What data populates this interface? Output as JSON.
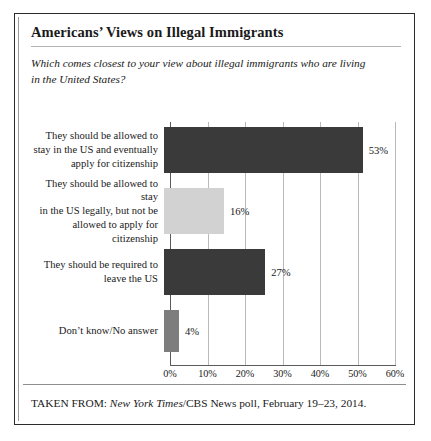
{
  "figure": {
    "title": "Americans’ Views on Illegal Immigrants",
    "subtitle": "Which comes closest to your view about illegal immigrants who are living in the United States?",
    "source_prefix": "TAKEN FROM: ",
    "source_italic": "New York Times",
    "source_rest": "/CBS News poll, February 19–23, 2014."
  },
  "chart_data": {
    "type": "bar",
    "orientation": "horizontal",
    "title": "Americans’ Views on Illegal Immigrants",
    "subtitle": "Which comes closest to your view about illegal immigrants who are living in the United States?",
    "xlabel": "",
    "ylabel": "",
    "xlim": [
      0,
      60
    ],
    "xticks": [
      0,
      10,
      20,
      30,
      40,
      50,
      60
    ],
    "xtick_labels": [
      "0%",
      "10%",
      "20%",
      "30%",
      "40%",
      "50%",
      "60%"
    ],
    "grid": true,
    "legend": "none",
    "categories": [
      "They should be allowed to stay in the US and eventually apply for citizenship",
      "They should be allowed to stay in the US legally, but not be allowed to apply for citizenship",
      "They should be required to leave the US",
      "Don’t know/No answer"
    ],
    "values": [
      53,
      16,
      27,
      4
    ],
    "value_labels": [
      "53%",
      "16%",
      "27%",
      "4%"
    ],
    "bar_colors": [
      "#3a3a3a",
      "#d2d2d2",
      "#3a3a3a",
      "#7d7d7d"
    ]
  },
  "bars": [
    {
      "label_lines": [
        "They should be allowed to",
        "stay in the US and eventually",
        "apply for citizenship"
      ],
      "value": 53,
      "value_label": "53%",
      "color": "#3a3a3a"
    },
    {
      "label_lines": [
        "They should be allowed to stay",
        "in the US legally, but not be",
        "allowed to apply for citizenship"
      ],
      "value": 16,
      "value_label": "16%",
      "color": "#d2d2d2"
    },
    {
      "label_lines": [
        "They should be required to",
        "leave the US"
      ],
      "value": 27,
      "value_label": "27%",
      "color": "#3a3a3a"
    },
    {
      "label_lines": [
        "Don’t know/No answer"
      ],
      "value": 4,
      "value_label": "4%",
      "color": "#7d7d7d"
    }
  ],
  "axis": {
    "ticks": [
      "0%",
      "10%",
      "20%",
      "30%",
      "40%",
      "50%",
      "60%"
    ]
  }
}
